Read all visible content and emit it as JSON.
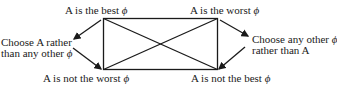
{
  "diagram": {
    "nodes": {
      "top_left": {
        "text": "A is the best",
        "symbol": "ϕ"
      },
      "top_right": {
        "text": "A is the worst",
        "symbol": "ϕ"
      },
      "bottom_left": {
        "text": "A is not the worst",
        "symbol": "ϕ"
      },
      "bottom_right": {
        "text": "A is not the best",
        "symbol": "ϕ"
      }
    },
    "side_labels": {
      "left_line1": "Choose A rather",
      "left_line2": "than any other",
      "left_symbol": "ϕ",
      "right_line1": "Choose any other",
      "right_symbol": "ϕ",
      "right_line2": "rather than A"
    },
    "line_color": "#1a1a1a"
  }
}
